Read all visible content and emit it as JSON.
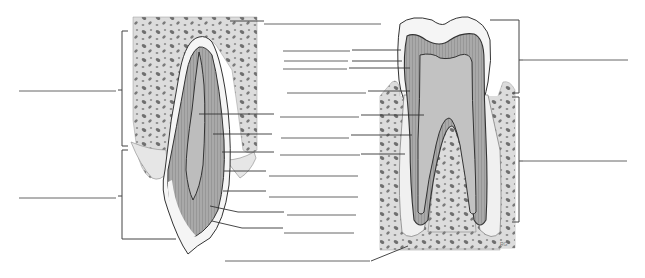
{
  "diagram": {
    "title": "",
    "colors": {
      "background": "#ffffff",
      "bone": "#d9d9d9",
      "bone_spots": "#6f6f6f",
      "dentin": "#a8a8a8",
      "pulp": "#bdbdbd",
      "enamel": "#f4f4f4",
      "outline": "#333333",
      "label_line": "#555555"
    },
    "left_tooth": {
      "brackets": [
        {
          "id": "upper-bracket",
          "label": ""
        },
        {
          "id": "lower-bracket",
          "label": ""
        }
      ],
      "label_blanks": 12
    },
    "right_tooth": {
      "brackets": [
        {
          "id": "crown-bracket",
          "label": ""
        },
        {
          "id": "root-bracket",
          "label": ""
        }
      ],
      "label_blanks": 0
    },
    "center_label_blanks": [
      {
        "y": 24,
        "label": ""
      },
      {
        "y": 51,
        "label": ""
      },
      {
        "y": 61,
        "label": ""
      },
      {
        "y": 69,
        "label": ""
      },
      {
        "y": 93,
        "label": ""
      },
      {
        "y": 117,
        "label": ""
      },
      {
        "y": 138,
        "label": ""
      },
      {
        "y": 155,
        "label": ""
      },
      {
        "y": 176,
        "label": ""
      },
      {
        "y": 197,
        "label": ""
      },
      {
        "y": 215,
        "label": ""
      },
      {
        "y": 233,
        "label": ""
      },
      {
        "y": 260,
        "label": ""
      }
    ],
    "side_label_blanks": [
      {
        "side": "left",
        "y": 91,
        "label": ""
      },
      {
        "side": "left",
        "y": 198,
        "label": ""
      },
      {
        "side": "right",
        "y": 60,
        "label": ""
      },
      {
        "side": "right",
        "y": 161,
        "label": ""
      }
    ]
  }
}
